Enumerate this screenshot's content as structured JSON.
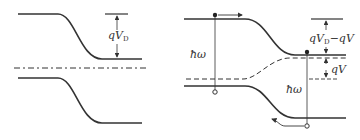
{
  "diagram": {
    "type": "energy-band-diagram",
    "panels": [
      {
        "id": "equilibrium",
        "labels": {
          "barrier": "qV",
          "barrier_sub": "D"
        },
        "elements": [
          "conduction-band",
          "valence-band",
          "fermi-level-dash-dot",
          "barrier-height-arrow"
        ]
      },
      {
        "id": "forward-bias",
        "labels": {
          "barrier": "qV",
          "barrier_sub": "D",
          "barrier_suffix": "−qV",
          "bias": "qV",
          "photon_left": "ħω",
          "photon_right": "ħω"
        },
        "elements": [
          "conduction-band",
          "valence-band",
          "quasi-fermi-level-dashed",
          "electron-dots",
          "hole-circles",
          "recombination-lines",
          "carrier-arrows"
        ]
      }
    ],
    "colors": {
      "line": "#333333",
      "background": "#ffffff"
    }
  }
}
